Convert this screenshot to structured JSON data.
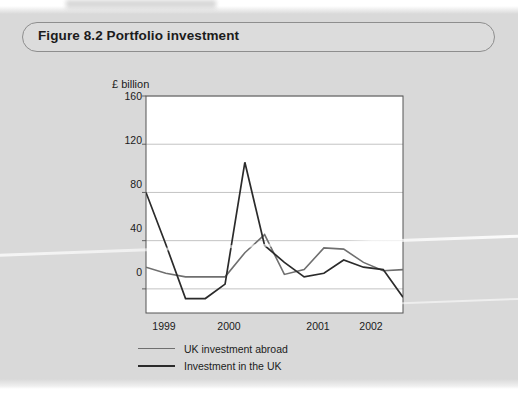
{
  "figure": {
    "label": "Figure 8.2",
    "title": "Figure 8.2  Portfolio investment",
    "caption": "Portfolio investment"
  },
  "chart_data": {
    "type": "line",
    "title": "Portfolio investment",
    "xlabel": "",
    "ylabel": "£ billion",
    "yunit_label": "£ billion",
    "ylim": [
      -20,
      160
    ],
    "yticks": [
      0,
      40,
      80,
      120,
      160
    ],
    "ytick_labels": [
      "0",
      "40",
      "80",
      "120",
      "160"
    ],
    "xticks": [
      1999,
      2000,
      2001,
      2002
    ],
    "xtick_labels": [
      "1999",
      "2000",
      "2001",
      "2002"
    ],
    "grid": "horizontal",
    "legend_position": "below-left",
    "x": [
      1998.75,
      1999.0,
      1999.25,
      1999.5,
      1999.75,
      2000.0,
      2000.25,
      2000.5,
      2000.75,
      2001.0,
      2001.25,
      2001.5,
      2001.75,
      2002.0
    ],
    "series": [
      {
        "name": "UK investment abroad",
        "color": "#6f6f6f",
        "width": 1.6,
        "values": [
          18,
          13,
          10,
          10,
          10,
          30,
          45,
          12,
          16,
          34,
          33,
          22,
          15,
          16
        ]
      },
      {
        "name": "Investment in the UK",
        "color": "#2b2b2b",
        "width": 1.7,
        "values": [
          80,
          37,
          -8,
          -8,
          4,
          105,
          36,
          22,
          10,
          13,
          24,
          18,
          16,
          -7
        ]
      }
    ]
  },
  "legend": {
    "items": [
      {
        "label": "UK investment abroad"
      },
      {
        "label": "Investment in the UK"
      }
    ]
  }
}
